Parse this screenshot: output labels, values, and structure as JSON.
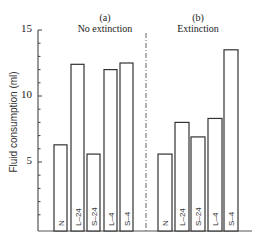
{
  "chart_data": {
    "type": "bar",
    "ylabel": "Fluid consumption (ml)",
    "ylim": [
      0,
      15
    ],
    "yticks": [
      5,
      10,
      15
    ],
    "grid": false,
    "legend": null,
    "panels": [
      {
        "letter": "(a)",
        "title": "No extinction",
        "categories": [
          "N",
          "L–24",
          "S–24",
          "L–4",
          "S–4"
        ],
        "values": [
          6.3,
          12.4,
          5.6,
          12.0,
          12.5
        ]
      },
      {
        "letter": "(b)",
        "title": "Extinction",
        "categories": [
          "N",
          "L–24",
          "S–24",
          "L–4",
          "S–4"
        ],
        "values": [
          5.6,
          8.0,
          6.9,
          8.3,
          13.5
        ]
      }
    ]
  }
}
